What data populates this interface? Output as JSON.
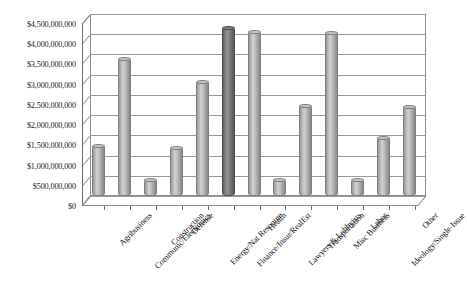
{
  "chart_data": {
    "type": "bar",
    "title": "",
    "subtitle": "",
    "xlabel": "",
    "ylabel": "",
    "ylim": [
      0,
      4500000000
    ],
    "ytick_step": 500000000,
    "grid": true,
    "legend": null,
    "legend_position": "none",
    "orientation": "vertical",
    "style_3d": true,
    "highlight_category": "Finance/Insur/RealEst",
    "colors": {
      "bar_fill": "#b4b4b4",
      "bar_highlight_fill": "#7a7a7a",
      "bar_outline": "#7d7d7d",
      "gridline": "#9a9a9a",
      "axis": "#6e6e6e",
      "plot_background": "#ffffff",
      "text": "#141414"
    },
    "ytick_labels": [
      "$0",
      "$500,000,000",
      "$1,000,000,000",
      "$1,500,000,000",
      "$2,000,000,000",
      "$2,500,000,000",
      "$3,000,000,000",
      "$3,500,000,000",
      "$4,000,000,000",
      "$4,500,000,000"
    ],
    "ytick_values": [
      0,
      500000000,
      1000000000,
      1500000000,
      2000000000,
      2500000000,
      3000000000,
      3500000000,
      4000000000,
      4500000000
    ],
    "categories": [
      "Agribusiness",
      "Communic/Electronics",
      "Construction",
      "Defense",
      "Energy/Nat Resource",
      "Finance/Insur/RealEst",
      "Health",
      "Lawyers & Lobbyists",
      "Transportation",
      "Misc Business",
      "Labor",
      "Ideology/Single-Issue",
      "Other"
    ],
    "values": [
      1270000000,
      3410000000,
      430000000,
      1220000000,
      2850000000,
      4170000000,
      4080000000,
      420000000,
      2250000000,
      4050000000,
      430000000,
      1470000000,
      2230000000
    ]
  }
}
